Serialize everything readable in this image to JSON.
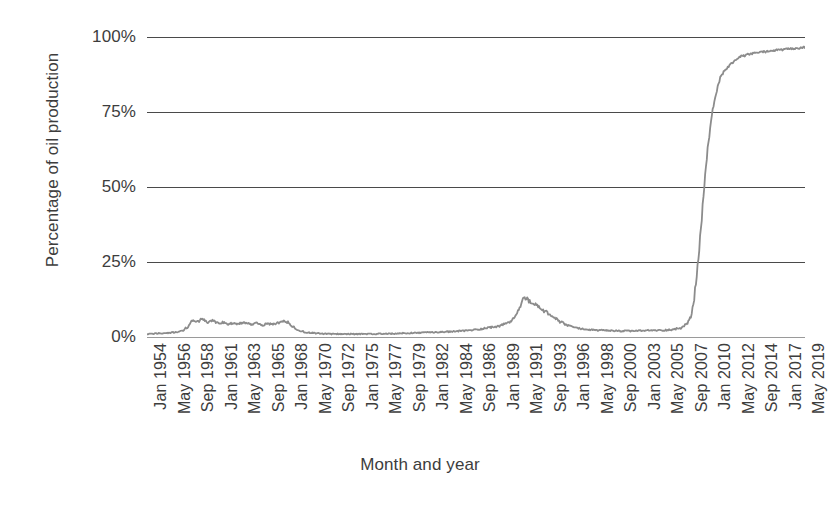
{
  "chart_data": {
    "type": "line",
    "title": "",
    "xlabel": "Month and year",
    "ylabel": "Percentage of oil production",
    "ylim": [
      0,
      100
    ],
    "ytick_labels": [
      "0%",
      "25%",
      "50%",
      "75%",
      "100%"
    ],
    "ytick_values": [
      0,
      25,
      50,
      75,
      100
    ],
    "grid": true,
    "legend": "none",
    "line_color": "#8c8c8c",
    "grid_color": "#4a4a4a",
    "text_color": "#3d3d3d",
    "background": "#ffffff",
    "x_tick_labels": [
      "Jan 1954",
      "May 1956",
      "Sep 1958",
      "Jan 1961",
      "May 1963",
      "Sep 1965",
      "Jan 1968",
      "May 1970",
      "Sep 1972",
      "Jan 1975",
      "May 1977",
      "Sep 1979",
      "Jan 1982",
      "May 1984",
      "Sep 1986",
      "Jan 1989",
      "May 1991",
      "Sep 1993",
      "Jan 1996",
      "May 1998",
      "Sep 2000",
      "Jan 2003",
      "May 2005",
      "Sep 2007",
      "Jan 2010",
      "May 2012",
      "Sep 2014",
      "Jan 2017",
      "May 2019"
    ],
    "x_tick_labels_shown": [
      "Jan 1954",
      "May 1956",
      "Sep 1958",
      "Jan 1961",
      "May 1963",
      "Sep 1965",
      "Jan 1968",
      "May 1970",
      "Sep 1972",
      "Jan 1975",
      "May 1977",
      "Sep 1979",
      "Jan 1982",
      "May 1984",
      "Sep 1986",
      "Jan 1989",
      "May 1991",
      "Sep 1993",
      "Jan 1996",
      "May 1998",
      "Sep 2000",
      "Jan 2003",
      "May 2005",
      "Sep 2007",
      "Jan 2010",
      "May 2012",
      "Sep 2014",
      "Jan 2017",
      "May 2019"
    ],
    "x_range": [
      "Jan 1954",
      "May 2019"
    ],
    "series": [
      {
        "name": "Percentage of oil production",
        "x": [
          "Jan 1954",
          "Jan 1955",
          "Jan 1956",
          "Jan 1957",
          "Jul 1957",
          "Jan 1958",
          "Jul 1958",
          "Jan 1959",
          "Jul 1959",
          "Jan 1960",
          "Jul 1960",
          "Jan 1961",
          "Jul 1961",
          "Jan 1962",
          "Jul 1962",
          "Jan 1963",
          "Jul 1963",
          "Jan 1964",
          "Jul 1964",
          "Jan 1965",
          "Jul 1965",
          "Jan 1966",
          "Jul 1966",
          "Jan 1967",
          "Jul 1967",
          "Jan 1968",
          "Jul 1968",
          "Jan 1969",
          "Jan 1970",
          "Jan 1971",
          "Jan 1972",
          "Jan 1974",
          "Jan 1976",
          "Jan 1978",
          "Jan 1980",
          "Jan 1982",
          "Jan 1984",
          "Jan 1985",
          "Jan 1986",
          "Jan 1987",
          "Jan 1988",
          "Jan 1989",
          "Jul 1989",
          "Jan 1990",
          "Jul 1990",
          "Jan 1991",
          "Apr 1991",
          "Jul 1991",
          "Oct 1991",
          "Jan 1992",
          "Jul 1992",
          "Jan 1993",
          "Jul 1993",
          "Jan 1994",
          "Jul 1994",
          "Jan 1995",
          "Jan 1996",
          "Jan 1997",
          "Jan 1998",
          "Jan 1999",
          "Jan 2000",
          "Jan 2001",
          "Jan 2002",
          "Jan 2003",
          "Jan 2004",
          "Jan 2005",
          "Jan 2006",
          "Jan 2007",
          "Jul 2007",
          "Jan 2008",
          "Apr 2008",
          "Jul 2008",
          "Oct 2008",
          "Jan 2009",
          "Apr 2009",
          "Jul 2009",
          "Oct 2009",
          "Jan 2010",
          "Apr 2010",
          "Jul 2010",
          "Oct 2010",
          "Jan 2011",
          "Jul 2011",
          "Jan 2012",
          "Jul 2012",
          "Jan 2013",
          "Jan 2014",
          "Jan 2015",
          "Jan 2016",
          "Jan 2017",
          "Jan 2018",
          "Jan 2019",
          "May 2019"
        ],
        "values": [
          1.0,
          1.2,
          1.4,
          1.6,
          2.0,
          3.2,
          5.6,
          5.2,
          6.0,
          5.0,
          5.4,
          4.6,
          4.8,
          4.4,
          4.6,
          4.2,
          4.8,
          4.4,
          4.2,
          4.6,
          4.0,
          4.4,
          4.2,
          4.6,
          5.2,
          5.0,
          3.4,
          2.2,
          1.5,
          1.2,
          1.0,
          1.0,
          1.0,
          1.1,
          1.3,
          1.5,
          1.8,
          2.0,
          2.2,
          2.6,
          3.2,
          3.6,
          4.4,
          5.0,
          6.4,
          9.6,
          12.0,
          13.6,
          12.4,
          11.6,
          10.8,
          9.8,
          8.6,
          7.4,
          6.2,
          5.0,
          3.6,
          2.8,
          2.4,
          2.2,
          2.1,
          2.0,
          2.0,
          2.1,
          2.2,
          2.2,
          2.4,
          3.0,
          4.0,
          6.5,
          11.0,
          18.0,
          26.0,
          36.0,
          47.0,
          57.0,
          65.0,
          72.0,
          77.0,
          81.0,
          84.5,
          87.0,
          89.5,
          91.0,
          92.5,
          93.5,
          94.4,
          95.0,
          95.4,
          95.8,
          96.0,
          96.3,
          96.6
        ]
      }
    ],
    "annotations": []
  }
}
